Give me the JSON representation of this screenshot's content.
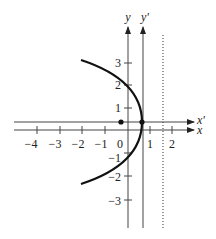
{
  "figure": {
    "axes": {
      "x_label": "x",
      "x_prime_label": "x'",
      "y_label": "y",
      "y_prime_label": "y'"
    },
    "x_ticks": [
      "−4",
      "−3",
      "−2",
      "−1",
      "0",
      "1",
      "2"
    ],
    "y_ticks": [
      "3",
      "2",
      "1",
      "−1",
      "−2",
      "−3"
    ],
    "curve": "parabola opening left, vertex near (0.6, 0), crossing y-axis at y = 2 and y = −1",
    "dotted_line_x": 1.5,
    "origin_point": [
      0,
      0
    ],
    "vertex_point": [
      0.6,
      0
    ],
    "colors": {
      "ink": "#222222",
      "axis": "#555555"
    }
  }
}
